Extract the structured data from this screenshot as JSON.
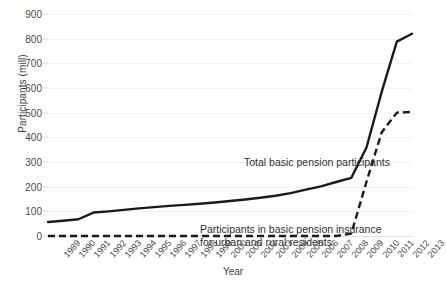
{
  "chart_data": {
    "type": "line",
    "title": "",
    "xlabel": "Year",
    "ylabel": "Participants (mill)",
    "ylim": [
      0,
      900
    ],
    "ytick_step": 100,
    "grid": true,
    "legend_position": "inline-annotations",
    "categories": [
      "1989",
      "1990",
      "1991",
      "1992",
      "1993",
      "1994",
      "1995",
      "1996",
      "1997",
      "1998",
      "1999",
      "2000",
      "2001",
      "2002",
      "2003",
      "2004",
      "2005",
      "2006",
      "2007",
      "2008",
      "2009",
      "2010",
      "2011",
      "2012",
      "2013"
    ],
    "yticks": [
      "0",
      "100",
      "200",
      "300",
      "400",
      "500",
      "600",
      "700",
      "800",
      "900"
    ],
    "series": [
      {
        "name": "Total basic pension participants",
        "style": "solid",
        "color": "#1a1a1a",
        "values": [
          57,
          62,
          68,
          95,
          100,
          106,
          112,
          117,
          122,
          126,
          131,
          136,
          142,
          148,
          155,
          163,
          174,
          188,
          201,
          219,
          236,
          359,
          584,
          788,
          820
        ]
      },
      {
        "name": "Participants in basic pension insurance for urban and rural residents",
        "style": "dashed",
        "color": "#1a1a1a",
        "values": [
          0,
          0,
          0,
          0,
          0,
          0,
          0,
          0,
          0,
          0,
          0,
          0,
          0,
          0,
          0,
          0,
          0,
          0,
          0,
          0,
          10,
          220,
          420,
          500,
          503
        ]
      }
    ],
    "annotations": [
      {
        "id": "annot-total",
        "text": "Total basic pension participants"
      },
      {
        "id": "annot-urban",
        "text": "Participants in basic pension insurance for urban and rural residents"
      }
    ]
  },
  "colors": {
    "background": "#ffffff",
    "gridline": "#f0f0f0",
    "line": "#1a1a1a",
    "text": "#3a3a3a"
  }
}
